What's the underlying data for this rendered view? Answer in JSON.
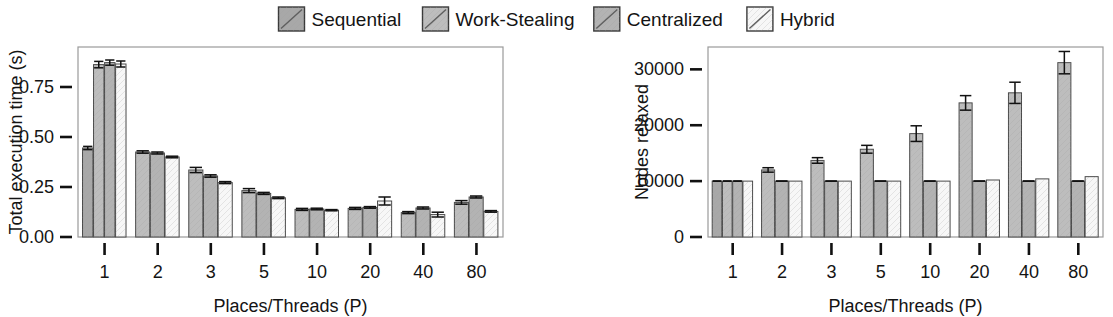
{
  "legend": {
    "position": "top-center",
    "entries": [
      {
        "label": "Sequential",
        "color": "#a8a8a8"
      },
      {
        "label": "Work-Stealing",
        "color": "#bdbdbd"
      },
      {
        "label": "Centralized",
        "color": "#b3b3b3"
      },
      {
        "label": "Hybrid",
        "color": "#f7f7f7"
      }
    ]
  },
  "chart_data": [
    {
      "type": "bar",
      "id": "total-execution-time",
      "title": "",
      "xlabel": "Places/Threads (P)",
      "ylabel": "Total execution time (s)",
      "categories": [
        "1",
        "2",
        "3",
        "5",
        "10",
        "20",
        "40",
        "80"
      ],
      "ylim": [
        0,
        0.95
      ],
      "yticks": [
        0.0,
        0.25,
        0.5,
        0.75
      ],
      "ytick_labels": [
        "0.00",
        "0.25",
        "0.50",
        "0.75"
      ],
      "grid": false,
      "series": [
        {
          "name": "Sequential",
          "color": "#a8a8a8",
          "values": [
            0.445,
            null,
            null,
            null,
            null,
            null,
            null,
            null
          ],
          "errors": [
            0.008,
            null,
            null,
            null,
            null,
            null,
            null,
            null
          ]
        },
        {
          "name": "Work-Stealing",
          "color": "#bdbdbd",
          "values": [
            0.862,
            0.425,
            0.335,
            0.232,
            0.138,
            0.143,
            0.122,
            0.173
          ],
          "errors": [
            0.016,
            0.006,
            0.013,
            0.01,
            0.005,
            0.005,
            0.005,
            0.009
          ]
        },
        {
          "name": "Centralized",
          "color": "#b3b3b3",
          "values": [
            0.872,
            0.42,
            0.305,
            0.218,
            0.14,
            0.148,
            0.145,
            0.2
          ],
          "errors": [
            0.013,
            0.005,
            0.006,
            0.005,
            0.004,
            0.004,
            0.005,
            0.005
          ]
        },
        {
          "name": "Hybrid",
          "color": "#f7f7f7",
          "values": [
            0.865,
            0.4,
            0.272,
            0.196,
            0.134,
            0.18,
            0.112,
            0.128
          ],
          "errors": [
            0.015,
            0.004,
            0.005,
            0.004,
            0.003,
            0.02,
            0.012,
            0.004
          ]
        }
      ]
    },
    {
      "type": "bar",
      "id": "nodes-relaxed",
      "title": "",
      "xlabel": "Places/Threads (P)",
      "ylabel": "Nodes relaxed",
      "categories": [
        "1",
        "2",
        "3",
        "5",
        "10",
        "20",
        "40",
        "80"
      ],
      "ylim": [
        0,
        34000
      ],
      "yticks": [
        0,
        10000,
        20000,
        30000
      ],
      "ytick_labels": [
        "0",
        "10000",
        "20000",
        "30000"
      ],
      "grid": false,
      "series": [
        {
          "name": "Sequential",
          "color": "#a8a8a8",
          "values": [
            10000,
            null,
            null,
            null,
            null,
            null,
            null,
            null
          ],
          "errors": [
            0,
            null,
            null,
            null,
            null,
            null,
            null,
            null
          ]
        },
        {
          "name": "Work-Stealing",
          "color": "#bdbdbd",
          "values": [
            10000,
            12000,
            13700,
            15700,
            18500,
            24000,
            25800,
            31200
          ],
          "errors": [
            0,
            400,
            500,
            700,
            1400,
            1300,
            1900,
            2000
          ]
        },
        {
          "name": "Centralized",
          "color": "#b3b3b3",
          "values": [
            10000,
            10000,
            10000,
            10000,
            10000,
            10000,
            10000,
            10000
          ],
          "errors": [
            0,
            0,
            0,
            0,
            0,
            0,
            0,
            0
          ]
        },
        {
          "name": "Hybrid",
          "color": "#f7f7f7",
          "values": [
            10000,
            10000,
            10000,
            10000,
            10000,
            10200,
            10400,
            10800
          ]
        }
      ]
    }
  ]
}
